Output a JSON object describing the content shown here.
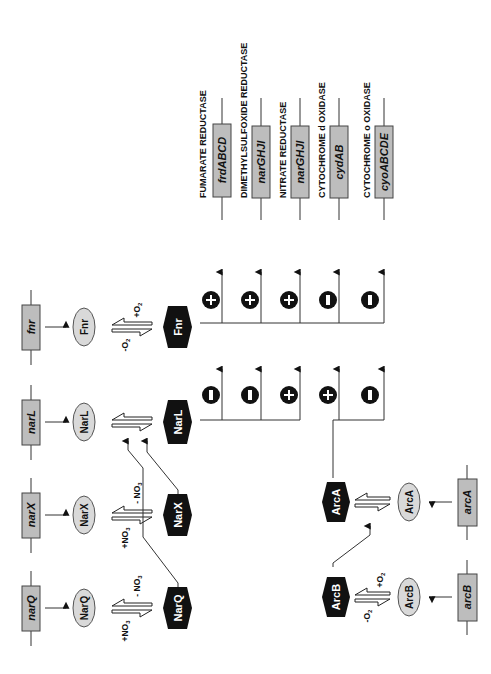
{
  "regulators": [
    {
      "gene": "narQ",
      "protein": "NarQ",
      "active": "NarQ",
      "signal_plus": "+NO3",
      "signal_minus": "- NO3"
    },
    {
      "gene": "narX",
      "protein": "NarX",
      "active": "NarX",
      "signal_plus": "+NO3",
      "signal_minus": "- NO3"
    },
    {
      "gene": "narL",
      "protein": "NarL",
      "active": "NarL"
    },
    {
      "gene": "fnr",
      "protein": "Fnr",
      "active": "Fnr",
      "signal_plus": "+O2",
      "signal_minus": "-O2"
    },
    {
      "gene": "arcB",
      "protein": "ArcB",
      "active": "ArcB",
      "signal_plus": "+O2",
      "signal_minus": "-O2"
    },
    {
      "gene": "arcA",
      "protein": "ArcA",
      "active": "ArcA"
    }
  ],
  "targets": [
    {
      "label": "FUMARATE REDUCTASE",
      "operon": "frdABCD"
    },
    {
      "label": "DIMETHYLSULFOXIDE REDUCTASE",
      "operon": "dmsABC"
    },
    {
      "label": "NITRATE REDUCTASE",
      "operon": "narGHJI"
    },
    {
      "label": "CYTOCHROME d OXIDASE",
      "operon": "cydAB"
    },
    {
      "label": "CYTOCHROME o OXIDASE",
      "operon": "cyoABCDE"
    }
  ],
  "regulation": {
    "Fnr": [
      "+",
      "+",
      "+",
      "-",
      "-"
    ],
    "NarL": [
      "-",
      "-",
      "+",
      null,
      null
    ],
    "ArcA": [
      null,
      null,
      null,
      "+",
      "-"
    ]
  },
  "signals": {
    "no3_plus": "+NO",
    "no3_minus": "- NO",
    "no3_sub": "3",
    "o2_plus": "+O",
    "o2_minus": "-O",
    "o2_sub": "2"
  },
  "colors": {
    "gene_box": "#bdbdbd",
    "protein_oval": "#d9d9d9",
    "active_hex": "#111111",
    "regulation_circle": "#111111"
  }
}
